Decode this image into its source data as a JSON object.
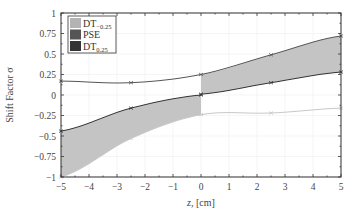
{
  "chart_data": {
    "type": "area",
    "title": "",
    "xlabel": "z, [cm]",
    "xlabel_parts": {
      "var": "z",
      "unit": ", [cm]"
    },
    "ylabel": "Shift Factor σ",
    "xlim": [
      -5,
      5
    ],
    "ylim": [
      -1,
      1
    ],
    "xticks": [
      -5,
      -4,
      -3,
      -2,
      -1,
      0,
      1,
      2,
      3,
      4,
      5
    ],
    "xtick_labels": [
      "−5",
      "−4",
      "−3",
      "−2",
      "−1",
      "0",
      "1",
      "2",
      "3",
      "4",
      "5"
    ],
    "yticks": [
      1,
      0.75,
      0.5,
      0.25,
      0,
      -0.25,
      -0.5,
      -0.75,
      -1
    ],
    "ytick_labels": [
      "1",
      "0.75",
      "0.5",
      "0.25",
      "0",
      "−0.25",
      "−0.5",
      "−0.75",
      "−1"
    ],
    "grid": true,
    "legend_position": "upper left",
    "legend": [
      {
        "label": "DT",
        "sub": "−0.25",
        "color": "#b3b3b3"
      },
      {
        "label": "PSE",
        "sub": "",
        "color": "#555555"
      },
      {
        "label": "DT",
        "sub": "0.25",
        "color": "#333333"
      }
    ],
    "series": [
      {
        "name": "upper",
        "color": "#555555",
        "x": [
          -5,
          -2.5,
          0,
          2.5,
          5
        ],
        "values": [
          0.17,
          0.15,
          0.25,
          0.49,
          0.72
        ]
      },
      {
        "name": "middle",
        "color": "#333333",
        "x": [
          -5,
          -2.5,
          0,
          0,
          2.5,
          5
        ],
        "values": [
          -0.44,
          -0.16,
          0.0,
          0.01,
          0.15,
          0.28
        ]
      },
      {
        "name": "lower",
        "color": "#c8c8c8",
        "x": [
          -5,
          -2.5,
          0,
          2.5,
          5
        ],
        "values": [
          -1.0,
          -0.53,
          -0.24,
          -0.22,
          -0.16
        ]
      }
    ],
    "bands": [
      {
        "name": "left-band",
        "x_range": [
          -5,
          0
        ],
        "between": [
          "middle",
          "lower"
        ],
        "color": "#c4c4c4"
      },
      {
        "name": "right-band",
        "x_range": [
          0,
          5
        ],
        "between": [
          "upper",
          "middle"
        ],
        "color": "#c4c4c4"
      }
    ],
    "markers_x": [
      -5,
      -2.5,
      0,
      2.5,
      5
    ]
  }
}
